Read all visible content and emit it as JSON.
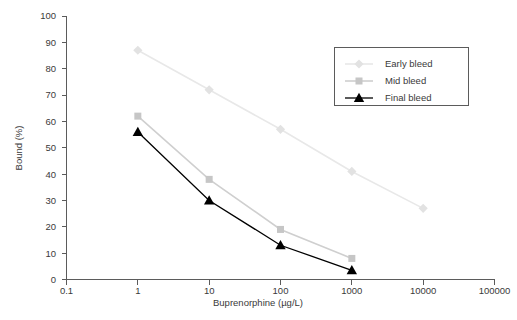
{
  "chart_data": {
    "type": "line",
    "title": "",
    "xlabel": "Buprenorphine (µg/L)",
    "ylabel": "Bound (%)",
    "xscale": "log",
    "xlim": [
      0.1,
      100000
    ],
    "ylim": [
      0,
      100
    ],
    "xticks": [
      "0.1",
      "1",
      "10",
      "100",
      "1000",
      "10000",
      "100000"
    ],
    "xtick_values": [
      0.1,
      1,
      10,
      100,
      1000,
      10000,
      100000
    ],
    "yticks": [
      "0",
      "10",
      "20",
      "30",
      "40",
      "50",
      "60",
      "70",
      "80",
      "90",
      "100"
    ],
    "ytick_values": [
      0,
      10,
      20,
      30,
      40,
      50,
      60,
      70,
      80,
      90,
      100
    ],
    "grid": false,
    "legend_position": "upper right",
    "series": [
      {
        "name": "Early bleed",
        "marker": "diamond",
        "color": "#e2e2e2",
        "line_color": "#e8e8e8",
        "x": [
          1,
          10,
          100,
          1000,
          10000
        ],
        "values": [
          87,
          72,
          57,
          41,
          27
        ]
      },
      {
        "name": "Mid bleed",
        "marker": "square",
        "color": "#c6c6c6",
        "line_color": "#cfcfcf",
        "x": [
          1,
          10,
          100,
          1000
        ],
        "values": [
          62,
          38,
          19,
          8
        ]
      },
      {
        "name": "Final bleed",
        "marker": "triangle",
        "color": "#000000",
        "line_color": "#000000",
        "x": [
          1,
          10,
          100,
          1000
        ],
        "values": [
          56,
          30,
          13,
          3.5
        ]
      }
    ]
  },
  "axes": {
    "x_title": "Buprenorphine (µg/L)",
    "y_title": "Bound (%)"
  },
  "legend": {
    "entries": [
      {
        "label": "Early bleed"
      },
      {
        "label": "Mid bleed"
      },
      {
        "label": "Final bleed"
      }
    ]
  }
}
